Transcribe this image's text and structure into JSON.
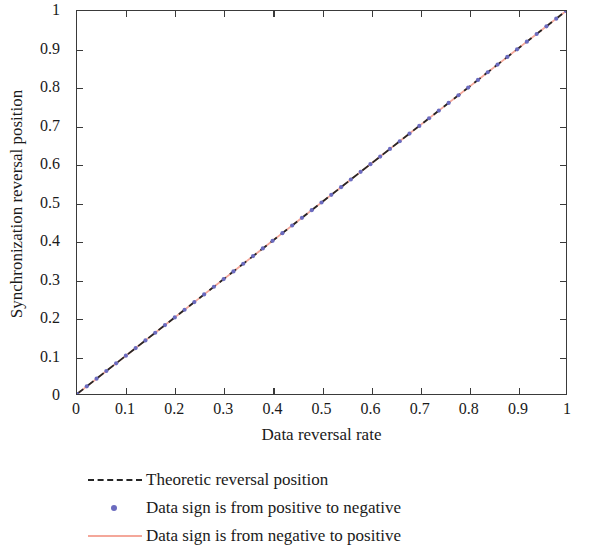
{
  "chart_data": {
    "type": "line",
    "title": "",
    "xlabel": "Data reversal rate",
    "ylabel": "Synchronization reversal position",
    "xlim": [
      0,
      1
    ],
    "ylim": [
      0,
      1
    ],
    "grid": false,
    "legend_position": "below-plot",
    "xticks": [
      "0",
      "0.1",
      "0.2",
      "0.3",
      "0.4",
      "0.5",
      "0.6",
      "0.7",
      "0.8",
      "0.9",
      "1"
    ],
    "xtick_values": [
      0,
      0.1,
      0.2,
      0.3,
      0.4,
      0.5,
      0.6,
      0.7,
      0.8,
      0.9,
      1
    ],
    "yticks": [
      "0",
      "0.1",
      "0.2",
      "0.3",
      "0.4",
      "0.5",
      "0.6",
      "0.7",
      "0.8",
      "0.9",
      "1"
    ],
    "ytick_values": [
      0,
      0.1,
      0.2,
      0.3,
      0.4,
      0.5,
      0.6,
      0.7,
      0.8,
      0.9,
      1
    ],
    "series": [
      {
        "name": "Theoretic reversal position",
        "style": "dashed",
        "color": "#262626",
        "marker": "none",
        "x": [
          0,
          1
        ],
        "values": [
          0,
          1
        ]
      },
      {
        "name": "Data sign is from positive to negative",
        "style": "markers",
        "color": "#6b6bbf",
        "marker": "dot",
        "x": [
          0,
          0.02,
          0.04,
          0.06,
          0.08,
          0.1,
          0.12,
          0.14,
          0.16,
          0.18,
          0.2,
          0.22,
          0.24,
          0.26,
          0.28,
          0.3,
          0.32,
          0.34,
          0.36,
          0.38,
          0.4,
          0.42,
          0.44,
          0.46,
          0.48,
          0.5,
          0.52,
          0.54,
          0.56,
          0.58,
          0.6,
          0.62,
          0.64,
          0.66,
          0.68,
          0.7,
          0.72,
          0.74,
          0.76,
          0.78,
          0.8,
          0.82,
          0.84,
          0.86,
          0.88,
          0.9,
          0.92,
          0.94,
          0.96,
          0.98,
          1
        ],
        "values": [
          0,
          0.02,
          0.04,
          0.06,
          0.08,
          0.1,
          0.12,
          0.14,
          0.16,
          0.18,
          0.2,
          0.22,
          0.24,
          0.26,
          0.28,
          0.3,
          0.32,
          0.34,
          0.36,
          0.38,
          0.4,
          0.42,
          0.44,
          0.46,
          0.48,
          0.5,
          0.52,
          0.54,
          0.56,
          0.58,
          0.6,
          0.62,
          0.64,
          0.66,
          0.68,
          0.7,
          0.72,
          0.74,
          0.76,
          0.78,
          0.8,
          0.82,
          0.84,
          0.86,
          0.88,
          0.9,
          0.92,
          0.94,
          0.96,
          0.98,
          1
        ]
      },
      {
        "name": "Data sign is from negative to positive",
        "style": "solid",
        "color": "#f4a79a",
        "marker": "none",
        "x": [
          0,
          0.02,
          0.04,
          0.06,
          0.08,
          0.1,
          0.12,
          0.14,
          0.16,
          0.18,
          0.2,
          0.22,
          0.24,
          0.26,
          0.28,
          0.3,
          0.32,
          0.34,
          0.36,
          0.38,
          0.4,
          0.42,
          0.44,
          0.46,
          0.48,
          0.5,
          0.52,
          0.54,
          0.56,
          0.58,
          0.6,
          0.62,
          0.64,
          0.66,
          0.68,
          0.7,
          0.72,
          0.74,
          0.76,
          0.78,
          0.8,
          0.82,
          0.84,
          0.86,
          0.88,
          0.9,
          0.92,
          0.94,
          0.96,
          0.98,
          1
        ],
        "values": [
          0,
          0.02,
          0.04,
          0.06,
          0.08,
          0.1,
          0.12,
          0.14,
          0.16,
          0.18,
          0.2,
          0.22,
          0.24,
          0.26,
          0.28,
          0.3,
          0.32,
          0.34,
          0.36,
          0.38,
          0.4,
          0.42,
          0.44,
          0.46,
          0.48,
          0.5,
          0.52,
          0.54,
          0.56,
          0.58,
          0.6,
          0.62,
          0.64,
          0.66,
          0.68,
          0.7,
          0.72,
          0.74,
          0.76,
          0.78,
          0.8,
          0.82,
          0.84,
          0.86,
          0.88,
          0.9,
          0.92,
          0.94,
          0.96,
          0.98,
          1
        ]
      }
    ]
  },
  "legend": {
    "items": [
      {
        "label": "Theoretic reversal position",
        "key": "dashed-line-key",
        "color": "#262626"
      },
      {
        "label": "Data sign is from positive to negative",
        "key": "dot-marker-key",
        "color": "#6b6bbf"
      },
      {
        "label": "Data sign is from negative to positive",
        "key": "solid-line-key",
        "color": "#f4a79a"
      }
    ]
  },
  "axes": {
    "frame_color": "#3a3a3a"
  }
}
